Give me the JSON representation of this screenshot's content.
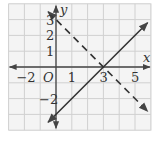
{
  "graph": {
    "type": "coordinate-plane",
    "x_range": [
      -3,
      6
    ],
    "y_range": [
      -4,
      4
    ],
    "grid_step": 1,
    "axis_labels": {
      "x": "x",
      "y": "y",
      "origin": "O"
    },
    "x_ticks": [
      {
        "value": -2,
        "label": "−2"
      },
      {
        "value": 1,
        "label": "1"
      },
      {
        "value": 3,
        "label": "3"
      },
      {
        "value": 5,
        "label": "5"
      }
    ],
    "y_ticks": [
      {
        "value": 3,
        "label": "3"
      },
      {
        "value": 2,
        "label": "2"
      },
      {
        "value": 1,
        "label": "1"
      },
      {
        "value": -2,
        "label": "−2"
      }
    ],
    "lines": [
      {
        "name": "solid-line",
        "equation": "y = x − 3",
        "style": "solid",
        "from": [
          -0.5,
          -3.5
        ],
        "to": [
          5.8,
          2.8
        ]
      },
      {
        "name": "dashed-line",
        "equation": "y = −x + 3",
        "style": "dashed",
        "from": [
          -0.5,
          3.5
        ],
        "to": [
          5.8,
          -2.8
        ]
      }
    ],
    "intersection": [
      3,
      0
    ],
    "colors": {
      "grid": "#d0d0d0",
      "background": "#f4f4f4",
      "axis": "#444444",
      "line": "#333333"
    }
  }
}
